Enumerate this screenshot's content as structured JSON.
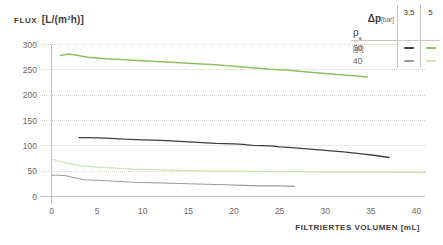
{
  "title": {
    "word": "FLUX",
    "units": "[L/(m²h)]"
  },
  "xaxis_label": "FILTRIERTES VOLUMEN [mL]",
  "legend": {
    "dp_symbol": "Δp",
    "dp_unit": "[bar]",
    "col_headers": [
      "3,5",
      "5"
    ],
    "rho_symbol": "ρ",
    "rho_sub": "s",
    "rho_unit": "[g/l]",
    "rows": [
      {
        "label": "30",
        "colors": [
          "#3F3F3F",
          "#8CC063"
        ]
      },
      {
        "label": "40",
        "colors": [
          "#9A9A9A",
          "#CFE3B4"
        ]
      }
    ]
  },
  "colors": {
    "background": "#FFFFFF",
    "grid": "#D8D5CC",
    "axis": "#C6C3BA",
    "text_dark": "#3E3A36",
    "tick_text": "#6E675F",
    "green_bright": "#8CC063",
    "green_pale": "#CFE3B4",
    "line_black": "#3F3F3F",
    "line_gray": "#9A9A9A"
  },
  "chart_data": {
    "type": "line",
    "title": "FLUX [L/(m²h)]",
    "xlabel": "FILTRIERTES VOLUMEN [mL]",
    "ylabel": "FLUX [L/(m²h)]",
    "xlim": [
      0,
      41
    ],
    "ylim": [
      0,
      300
    ],
    "xticks": [
      0,
      5,
      10,
      15,
      20,
      25,
      30,
      35,
      40
    ],
    "yticks": [
      0,
      50,
      100,
      150,
      200,
      250,
      300
    ],
    "grid": "horizontal-dotted",
    "legend_position": "top-right",
    "series": [
      {
        "name": "ρs 30 g/l, Δp 5 bar",
        "color": "#8CC063",
        "width": 1.5,
        "points": [
          [
            1,
            278
          ],
          [
            1.8,
            281
          ],
          [
            2.6,
            279
          ],
          [
            4,
            275
          ],
          [
            6,
            272
          ],
          [
            8,
            270
          ],
          [
            10,
            268
          ],
          [
            12,
            266
          ],
          [
            14,
            264
          ],
          [
            16,
            262
          ],
          [
            18,
            260
          ],
          [
            20,
            257
          ],
          [
            22,
            254
          ],
          [
            24,
            251
          ],
          [
            26,
            249
          ],
          [
            28,
            246
          ],
          [
            30,
            243
          ],
          [
            32,
            240
          ],
          [
            33.5,
            238
          ],
          [
            34.6,
            236
          ]
        ]
      },
      {
        "name": "ρs 30 g/l, Δp 3,5 bar",
        "color": "#3F3F3F",
        "width": 1.3,
        "points": [
          [
            3,
            116
          ],
          [
            4,
            116
          ],
          [
            6,
            115
          ],
          [
            8,
            113
          ],
          [
            10,
            112
          ],
          [
            12,
            111
          ],
          [
            14,
            109
          ],
          [
            16,
            107
          ],
          [
            18,
            105
          ],
          [
            20,
            104
          ],
          [
            21,
            103
          ],
          [
            22,
            101
          ],
          [
            24,
            100
          ],
          [
            25,
            98
          ],
          [
            26,
            97
          ],
          [
            28,
            94
          ],
          [
            30,
            91
          ],
          [
            32,
            88
          ],
          [
            34,
            84
          ],
          [
            35.5,
            81
          ],
          [
            37,
            77
          ]
        ]
      },
      {
        "name": "ρs 40 g/l, Δp 5 bar",
        "color": "#CFE3B4",
        "width": 1.2,
        "points": [
          [
            0,
            74
          ],
          [
            0.8,
            70
          ],
          [
            1.6,
            66
          ],
          [
            2.5,
            63
          ],
          [
            3.5,
            60
          ],
          [
            5,
            58
          ],
          [
            7,
            56
          ],
          [
            9,
            54
          ],
          [
            11,
            53
          ],
          [
            13,
            52
          ],
          [
            15,
            51
          ],
          [
            18,
            50
          ],
          [
            21,
            50
          ],
          [
            24,
            49
          ],
          [
            27,
            49
          ],
          [
            30,
            48
          ],
          [
            33,
            48
          ],
          [
            36,
            48
          ],
          [
            41,
            47
          ]
        ]
      },
      {
        "name": "ρs 40 g/l, Δp 3,5 bar",
        "color": "#9A9A9A",
        "width": 1.1,
        "points": [
          [
            0,
            42
          ],
          [
            1,
            42
          ],
          [
            1.6,
            41
          ],
          [
            2.3,
            38
          ],
          [
            3,
            35
          ],
          [
            3.6,
            33
          ],
          [
            5,
            32
          ],
          [
            6,
            31
          ],
          [
            7,
            30
          ],
          [
            9,
            28
          ],
          [
            11,
            27
          ],
          [
            13,
            26
          ],
          [
            15,
            25
          ],
          [
            17,
            24
          ],
          [
            19,
            23
          ],
          [
            21,
            22
          ],
          [
            23,
            21
          ],
          [
            25,
            21
          ],
          [
            26.6,
            20
          ]
        ]
      }
    ]
  }
}
